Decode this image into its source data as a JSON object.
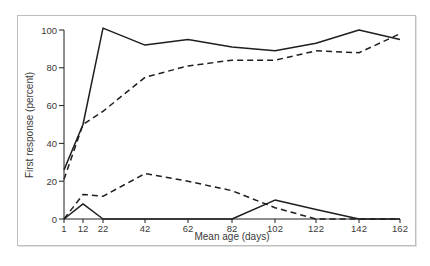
{
  "chart_data": {
    "type": "line",
    "title": "",
    "xlabel": "Mean age (days)",
    "ylabel": "First response (percent)",
    "x": [
      1,
      12,
      22,
      42,
      62,
      82,
      102,
      122,
      142,
      162
    ],
    "x_tick_labels": [
      "1",
      "12",
      "22",
      "42",
      "62",
      "82",
      "102",
      "122",
      "142",
      "162"
    ],
    "y_ticks": [
      0,
      20,
      40,
      60,
      80,
      100
    ],
    "y_tick_labels": [
      "0",
      "20",
      "40",
      "60",
      "80",
      "100"
    ],
    "xlim": [
      1,
      162
    ],
    "ylim": [
      0,
      100
    ],
    "grid": false,
    "legend": null,
    "series": [
      {
        "name": "upper-solid",
        "style": "solid",
        "color": "#1f1f1f",
        "values": [
          26,
          50,
          101,
          92,
          95,
          91,
          89,
          93,
          100,
          95
        ]
      },
      {
        "name": "upper-dashed",
        "style": "dashed",
        "color": "#1f1f1f",
        "values": [
          21,
          50,
          57,
          75,
          81,
          84,
          84,
          89,
          88,
          98
        ]
      },
      {
        "name": "lower-dashed",
        "style": "dashed",
        "color": "#1f1f1f",
        "values": [
          0,
          13,
          12,
          24,
          20,
          15,
          6,
          0,
          0,
          0
        ]
      },
      {
        "name": "lower-solid",
        "style": "solid",
        "color": "#1f1f1f",
        "values": [
          0,
          8,
          0,
          0,
          0,
          0,
          10,
          5,
          0,
          0
        ]
      }
    ]
  },
  "colors": {
    "ink": "#1f1f1f",
    "frame": "#bdbdbd",
    "background": "#ffffff"
  }
}
